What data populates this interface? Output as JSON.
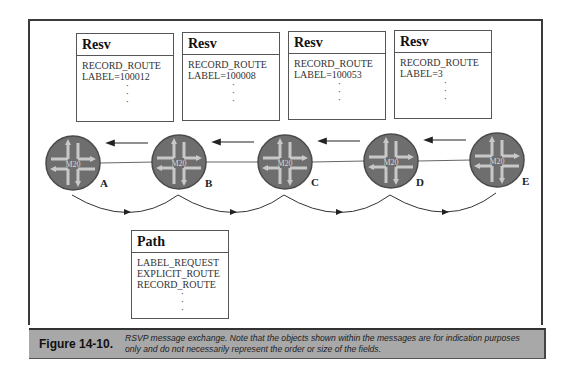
{
  "resv_messages": [
    {
      "title": "Resv",
      "fields": [
        "RECORD_ROUTE",
        "LABEL=100012"
      ]
    },
    {
      "title": "Resv",
      "fields": [
        "RECORD_ROUTE",
        "LABEL=100008"
      ]
    },
    {
      "title": "Resv",
      "fields": [
        "RECORD_ROUTE",
        "LABEL=100053"
      ]
    },
    {
      "title": "Resv",
      "fields": [
        "RECORD_ROUTE",
        "LABEL=3"
      ]
    }
  ],
  "path_message": {
    "title": "Path",
    "fields": [
      "LABEL_REQUEST",
      "EXPLICIT_ROUTE",
      "RECORD_ROUTE"
    ]
  },
  "routers": [
    {
      "id": "A",
      "model": "M20"
    },
    {
      "id": "B",
      "model": "M20"
    },
    {
      "id": "C",
      "model": "M20"
    },
    {
      "id": "D",
      "model": "M20"
    },
    {
      "id": "E",
      "model": "M20"
    }
  ],
  "ellipsis": "·",
  "caption": {
    "label": "Figure 14-10.",
    "text": "RSVP message exchange. Note that the objects shown within the messages are for indication purposes only and do not necessarily represent the order or size of the fields."
  },
  "colors": {
    "router_fill": "#6e6e6e",
    "router_arrow": "#c8c8c8",
    "caption_bg": "#a8a8a8",
    "frame": "#3a3a3a"
  }
}
